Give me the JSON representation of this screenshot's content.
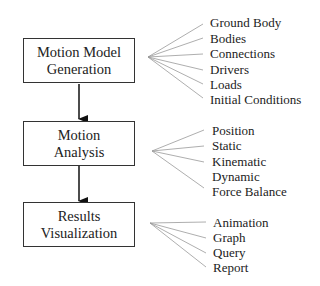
{
  "stages": [
    {
      "line1": "Motion Model",
      "line2": "Generation",
      "items": [
        "Ground Body",
        "Bodies",
        "Connections",
        "Drivers",
        "Loads",
        "Initial Conditions"
      ]
    },
    {
      "line1": "Motion",
      "line2": "Analysis",
      "items": [
        "Position",
        "Static",
        "Kinematic",
        "Dynamic",
        "Force Balance"
      ]
    },
    {
      "line1": "Results",
      "line2": "Visualization",
      "items": [
        "Animation",
        "Graph",
        "Query",
        "Report"
      ]
    }
  ]
}
